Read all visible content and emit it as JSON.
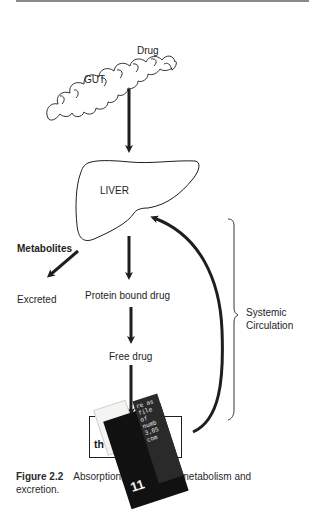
{
  "diagram": {
    "title": "Absorption, distribution, metabolism and excretion",
    "nodes": {
      "gut_label": "GUT",
      "drug_label": "Drug",
      "liver_label": "LIVER",
      "metabolites_label": "Metabolites",
      "excreted_label": "Excreted",
      "protein_bound_label": "Protein bound drug",
      "free_drug_label": "Free drug",
      "target_line1": "Drug at site",
      "target_line2": "of action",
      "systemic_line1": "Systemic",
      "systemic_line2": "Circulation"
    },
    "edges": [
      {
        "from": "GUT",
        "to": "LIVER"
      },
      {
        "from": "LIVER",
        "to": "Excreted",
        "via": "Metabolites"
      },
      {
        "from": "LIVER",
        "to": "Protein bound drug"
      },
      {
        "from": "Protein bound drug",
        "to": "Free drug"
      },
      {
        "from": "Free drug",
        "to": "Drug at site of action"
      },
      {
        "from": "Drug at site of action",
        "to": "LIVER",
        "style": "curved"
      }
    ],
    "bracket_label": "Systemic Circulation"
  },
  "target_box": {
    "line1_visible": "D",
    "line1_end": "site",
    "line2_start": "th",
    "line2_end": "ction"
  },
  "sticker": {
    "number": "11",
    "strip_text": "re as file of numb 3,05 com"
  },
  "caption": {
    "figure_number": "Figure 2.2",
    "text": "Absorption, distribution, metabolism and excretion."
  },
  "colors": {
    "ink": "#1e1e1e",
    "rule": "#8a8a8a",
    "background": "#ffffff"
  }
}
